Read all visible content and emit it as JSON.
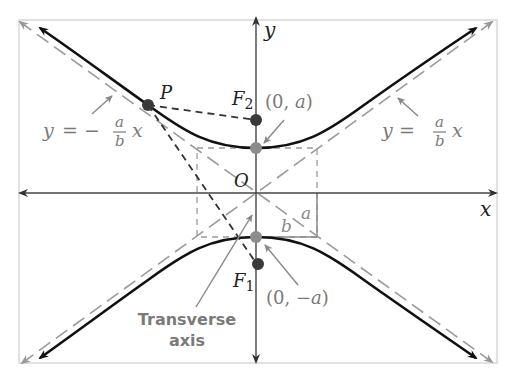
{
  "diagram": {
    "colors": {
      "curve": "#111111",
      "axis": "#444444",
      "asymptote": "#9a9a9a",
      "box": "#9a9a9a",
      "label_gray": "#7a7a7a",
      "focus_point": "#3a3a3a",
      "vertex_point": "#8c8c8c",
      "frame": "#d8d8d8"
    },
    "axes": {
      "x_label": "x",
      "y_label": "y",
      "origin_label": "O"
    },
    "points": {
      "P": "P",
      "F2": "F",
      "F2_sub": "2",
      "F1": "F",
      "F1_sub": "1"
    },
    "vertex_labels": {
      "top_open": "(0, ",
      "top_var": "a",
      "top_close": ")",
      "bottom_open": "(0, −",
      "bottom_var": "a",
      "bottom_close": ")"
    },
    "asymptote_labels": {
      "left_lhs": "y",
      "left_eq": "= −",
      "left_num": "a",
      "left_den": "b",
      "left_x": "x",
      "right_lhs": "y",
      "right_eq": "=",
      "right_num": "a",
      "right_den": "b",
      "right_x": "x"
    },
    "box_labels": {
      "b": "b",
      "a": "a"
    },
    "transverse_axis": {
      "line1": "Transverse",
      "line2": "axis"
    }
  }
}
